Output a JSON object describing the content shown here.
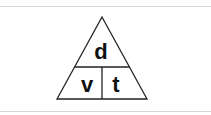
{
  "diagram": {
    "top_label": "d",
    "bottom_left_label": "v",
    "bottom_right_label": "t",
    "line_color": "#222222",
    "fill_color": "#ffffff"
  }
}
